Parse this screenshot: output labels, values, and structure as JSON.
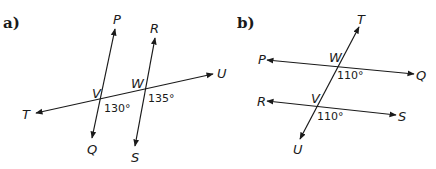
{
  "diagrams": [
    {
      "part_label": "a)",
      "points": {
        "P": "P",
        "Q": "Q",
        "R": "R",
        "S": "S",
        "T": "T",
        "U": "U",
        "V": "V",
        "W": "W"
      },
      "angles": {
        "at_V": "130°",
        "at_W": "135°"
      }
    },
    {
      "part_label": "b)",
      "points": {
        "P": "P",
        "Q": "Q",
        "R": "R",
        "S": "S",
        "T": "T",
        "U": "U",
        "V": "V",
        "W": "W"
      },
      "angles": {
        "at_W": "110°",
        "at_V": "110°"
      }
    }
  ]
}
